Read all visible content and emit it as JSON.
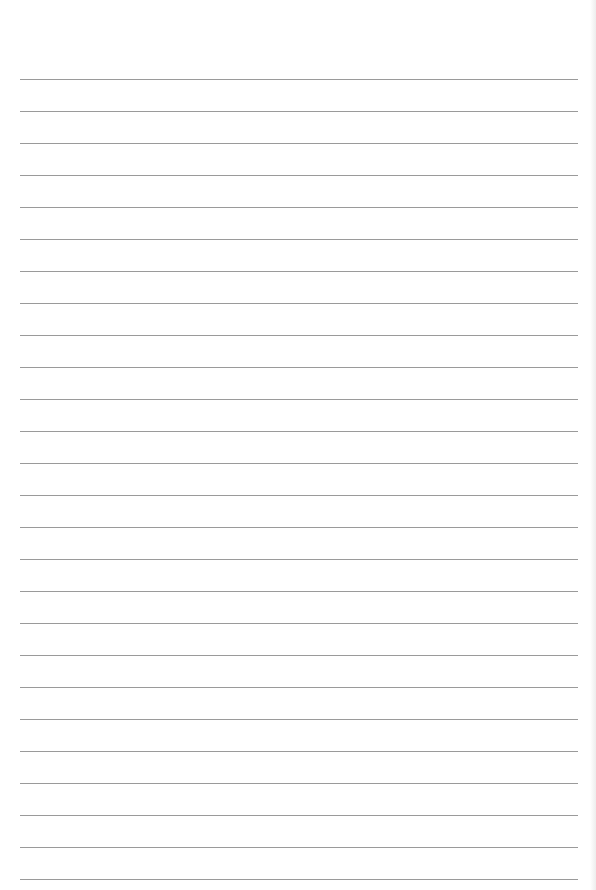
{
  "page": {
    "type": "lined-paper",
    "background_color": "#ffffff",
    "line_color": "#9a9a9a",
    "line_count": 26,
    "first_line_y": 79,
    "line_spacing": 32,
    "line_left": 20,
    "line_right": 578
  }
}
